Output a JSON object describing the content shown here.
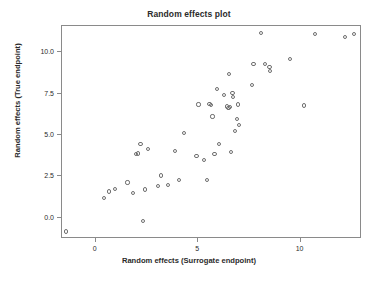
{
  "chart_data": {
    "type": "scatter",
    "title": "Random effects plot",
    "xlabel": "Random effects (Surrogate endpoint)",
    "ylabel": "Random effects (True endpoint)",
    "xlim": [
      -1.65,
      13.0
    ],
    "ylim": [
      -1.3,
      11.6
    ],
    "xticks": [
      0,
      5,
      10
    ],
    "xtick_labels": [
      "0",
      "5",
      "10"
    ],
    "yticks": [
      0.0,
      2.5,
      5.0,
      7.5,
      10.0
    ],
    "ytick_labels": [
      "0.0",
      "2.5",
      "5.0",
      "7.5",
      "10.0"
    ],
    "grid": false,
    "legend": null,
    "marker": "open-circle",
    "marker_color": "#6e6e6e",
    "series": [
      {
        "name": "trial random effects",
        "points": [
          [
            -1.45,
            -0.85
          ],
          [
            0.42,
            1.17
          ],
          [
            0.63,
            1.58
          ],
          [
            0.95,
            1.73
          ],
          [
            1.55,
            2.12
          ],
          [
            1.82,
            1.47
          ],
          [
            1.98,
            3.85
          ],
          [
            2.07,
            3.88
          ],
          [
            2.18,
            4.47
          ],
          [
            2.3,
            -0.22
          ],
          [
            2.4,
            1.7
          ],
          [
            2.55,
            4.15
          ],
          [
            3.05,
            1.92
          ],
          [
            3.17,
            2.55
          ],
          [
            3.52,
            1.95
          ],
          [
            3.88,
            4.02
          ],
          [
            4.08,
            2.25
          ],
          [
            4.3,
            5.1
          ],
          [
            4.92,
            3.75
          ],
          [
            5.02,
            6.85
          ],
          [
            5.28,
            3.5
          ],
          [
            5.42,
            2.28
          ],
          [
            5.55,
            6.88
          ],
          [
            5.62,
            6.82
          ],
          [
            5.7,
            6.12
          ],
          [
            5.8,
            3.85
          ],
          [
            5.92,
            7.8
          ],
          [
            6.0,
            4.45
          ],
          [
            6.28,
            7.42
          ],
          [
            6.4,
            6.72
          ],
          [
            6.48,
            6.62
          ],
          [
            6.52,
            8.68
          ],
          [
            6.55,
            6.68
          ],
          [
            6.62,
            3.98
          ],
          [
            6.68,
            7.52
          ],
          [
            6.72,
            7.28
          ],
          [
            6.78,
            5.22
          ],
          [
            6.88,
            5.98
          ],
          [
            6.95,
            6.85
          ],
          [
            6.98,
            5.58
          ],
          [
            7.62,
            8.02
          ],
          [
            7.7,
            9.32
          ],
          [
            8.05,
            11.18
          ],
          [
            8.25,
            9.32
          ],
          [
            8.48,
            9.12
          ],
          [
            8.52,
            8.88
          ],
          [
            9.48,
            9.62
          ],
          [
            10.18,
            6.78
          ],
          [
            10.72,
            11.12
          ],
          [
            12.18,
            10.92
          ],
          [
            12.62,
            11.12
          ]
        ]
      }
    ]
  },
  "axes": {
    "plot_left_px": 61,
    "plot_top_px": 25,
    "plot_width_px": 300,
    "plot_height_px": 213
  }
}
